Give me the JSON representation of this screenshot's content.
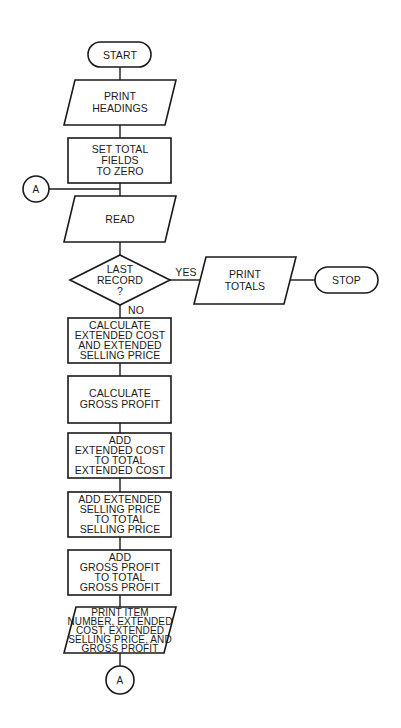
{
  "flowchart": {
    "start": {
      "label": "START"
    },
    "print_headings": {
      "lines": [
        "PRINT",
        "HEADINGS"
      ]
    },
    "set_totals": {
      "lines": [
        "SET TOTAL",
        "FIELDS",
        "TO ZERO"
      ]
    },
    "connector_in": {
      "label": "A"
    },
    "read": {
      "lines": [
        "READ"
      ]
    },
    "decision": {
      "lines": [
        "LAST",
        "RECORD",
        "?"
      ],
      "yes_label": "YES",
      "no_label": "NO"
    },
    "print_totals": {
      "lines": [
        "PRINT",
        "TOTALS"
      ]
    },
    "stop": {
      "label": "STOP"
    },
    "calc_extended": {
      "lines": [
        "CALCULATE",
        "EXTENDED COST",
        "AND EXTENDED",
        "SELLING PRICE"
      ]
    },
    "calc_gross": {
      "lines": [
        "CALCULATE",
        "GROSS PROFIT"
      ]
    },
    "add_ext_cost": {
      "lines": [
        "ADD",
        "EXTENDED COST",
        "TO TOTAL",
        "EXTENDED COST"
      ]
    },
    "add_ext_sell": {
      "lines": [
        "ADD EXTENDED",
        "SELLING PRICE",
        "TO TOTAL",
        "SELLING PRICE"
      ]
    },
    "add_gross": {
      "lines": [
        "ADD",
        "GROSS PROFIT",
        "TO TOTAL",
        "GROSS PROFIT"
      ]
    },
    "print_item": {
      "lines": [
        "PRINT ITEM",
        "NUMBER, EXTENDED",
        "COST, EXTENDED",
        "SELLING PRICE, AND",
        "GROSS PROFIT"
      ]
    },
    "connector_out": {
      "label": "A"
    }
  }
}
